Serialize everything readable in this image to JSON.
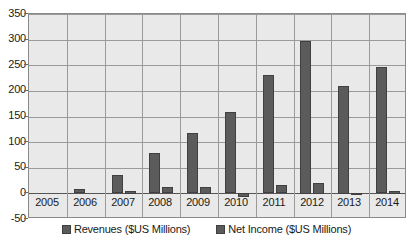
{
  "chart_data": {
    "type": "bar",
    "title": "",
    "subtitle": "",
    "xlabel": "",
    "ylabel": "",
    "categories": [
      "2005",
      "2006",
      "2007",
      "2008",
      "2009",
      "2010",
      "2011",
      "2012",
      "2013",
      "2014"
    ],
    "series": [
      {
        "name": "Revenues ($US Millions)",
        "values": [
          0,
          8,
          35,
          78,
          117,
          158,
          231,
          298,
          210,
          246
        ],
        "color": "#5b5b5b"
      },
      {
        "name": "Net Income ($US Millions)",
        "values": [
          0,
          0,
          5,
          12,
          13,
          -7,
          16,
          21,
          -4,
          5
        ],
        "color": "#5b5b5b"
      }
    ],
    "ylim": [
      -50,
      350
    ],
    "yticks": [
      -50,
      0,
      50,
      100,
      150,
      200,
      250,
      300,
      350
    ],
    "ytick_labels": [
      "-50",
      "0",
      "50",
      "100",
      "150",
      "200",
      "250",
      "300",
      "350"
    ],
    "grid": true,
    "legend_position": "bottom",
    "plot_background": "#e9e9e9",
    "grid_color": "#9a9a9a",
    "axis_color": "#8a8a8a",
    "text_color": "#1a1a1a"
  },
  "legend": {
    "items": [
      {
        "label": "Revenues ($US Millions)",
        "swatch_name": "legend-swatch-revenues"
      },
      {
        "label": "Net Income ($US Millions)",
        "swatch_name": "legend-swatch-net-income"
      }
    ]
  }
}
